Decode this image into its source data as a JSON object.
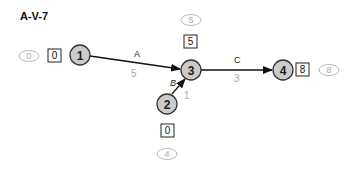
{
  "title": "A-V-7",
  "colors": {
    "node_fill": "#cccccc",
    "node_stroke": "#333333",
    "edge": "#111111",
    "oval_stroke": "#bbbbbb",
    "oval_text": "#aaaaaa",
    "duration_text": "#aaaaaa"
  },
  "nodes": [
    {
      "id": "1",
      "label": "1",
      "earliest": "0",
      "latest": "0"
    },
    {
      "id": "2",
      "label": "2",
      "earliest": "0",
      "latest": "4"
    },
    {
      "id": "3",
      "label": "3",
      "earliest": "5",
      "latest": "5"
    },
    {
      "id": "4",
      "label": "4",
      "earliest": "8",
      "latest": "8"
    }
  ],
  "edges": [
    {
      "id": "A",
      "label": "A",
      "from": "1",
      "to": "3",
      "duration": "5"
    },
    {
      "id": "B",
      "label": "B",
      "from": "2",
      "to": "3",
      "duration": "1"
    },
    {
      "id": "C",
      "label": "C",
      "from": "3",
      "to": "4",
      "duration": "3"
    }
  ]
}
